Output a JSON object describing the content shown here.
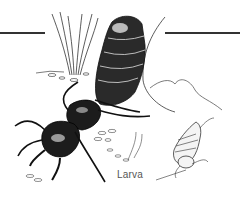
{
  "illustration": {
    "subject": "Rove beetle adult with larva",
    "labels": {
      "larva": "Larva"
    },
    "colors": {
      "ink": "#1a1a1a",
      "background": "#ffffff",
      "rule": "#333333",
      "label": "#555555"
    }
  }
}
